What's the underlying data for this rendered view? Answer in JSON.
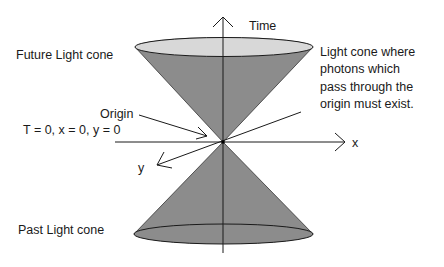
{
  "labels": {
    "time_axis": "Time",
    "x_axis": "x",
    "y_axis": "y",
    "future_cone": "Future Light cone",
    "past_cone": "Past Light cone",
    "origin": "Origin",
    "origin_coords": "T = 0, x = 0, y = 0",
    "cone_description": [
      "Light cone where",
      "photons which",
      "pass through the",
      "origin must exist."
    ]
  },
  "colors": {
    "cone_fill": "#8c8c8c",
    "top_ellipse_fill": "#d8d8d8",
    "bottom_ellipse_fill": "#8c8c8c",
    "line": "#1a1a1a",
    "background": "#ffffff"
  }
}
